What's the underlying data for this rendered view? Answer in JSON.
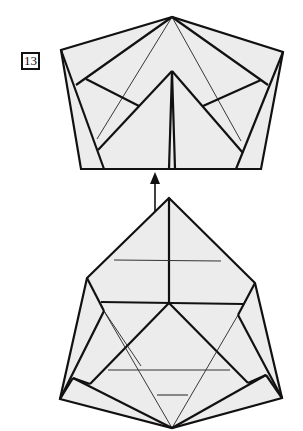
{
  "diagram": {
    "type": "origami-folding-step",
    "step": {
      "number": "13",
      "label": "Step 13"
    },
    "figures": [
      {
        "id": "result",
        "description": "Pentagon-shaped folded model after folding flap up",
        "position": "top"
      },
      {
        "id": "before",
        "description": "Folded model with triangular flap pointing up; arrow indicates fold upward",
        "position": "bottom"
      }
    ],
    "arrow": {
      "direction": "up",
      "meaning": "fold-up"
    },
    "colors": {
      "paper": "#ececec",
      "line": "#111111",
      "background": "#ffffff"
    }
  }
}
